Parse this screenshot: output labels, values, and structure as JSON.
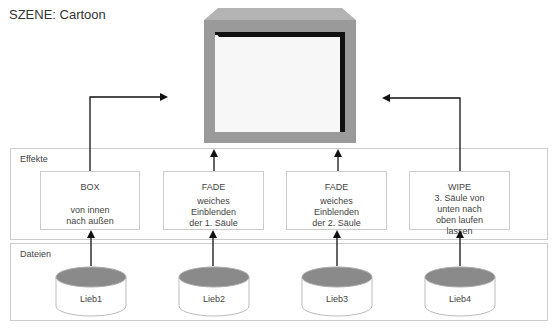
{
  "title": "SZENE: Cartoon",
  "panels": {
    "effects_label": "Effekte",
    "files_label": "Dateien"
  },
  "effects": [
    {
      "name": "BOX",
      "desc": [
        "von innen",
        "nach außen"
      ]
    },
    {
      "name": "FADE",
      "desc": [
        "weiches",
        "Einblenden",
        "der 1. Säule"
      ]
    },
    {
      "name": "FADE",
      "desc": [
        "weiches",
        "Einblenden",
        "der 2. Säule"
      ]
    },
    {
      "name": "WIPE",
      "desc": [
        "3. Säule von",
        "unten nach",
        "oben laufen",
        "lassen"
      ]
    }
  ],
  "files": [
    {
      "label": "Lieb1"
    },
    {
      "label": "Lieb2"
    },
    {
      "label": "Lieb3"
    },
    {
      "label": "Lieb4"
    }
  ],
  "colors": {
    "monitor_frame": "#9a9a9a",
    "monitor_top": "#b4b4b4",
    "cylinder_top": "#8a8a8a",
    "panel_border": "#cccccc",
    "arrow": "#111111"
  }
}
